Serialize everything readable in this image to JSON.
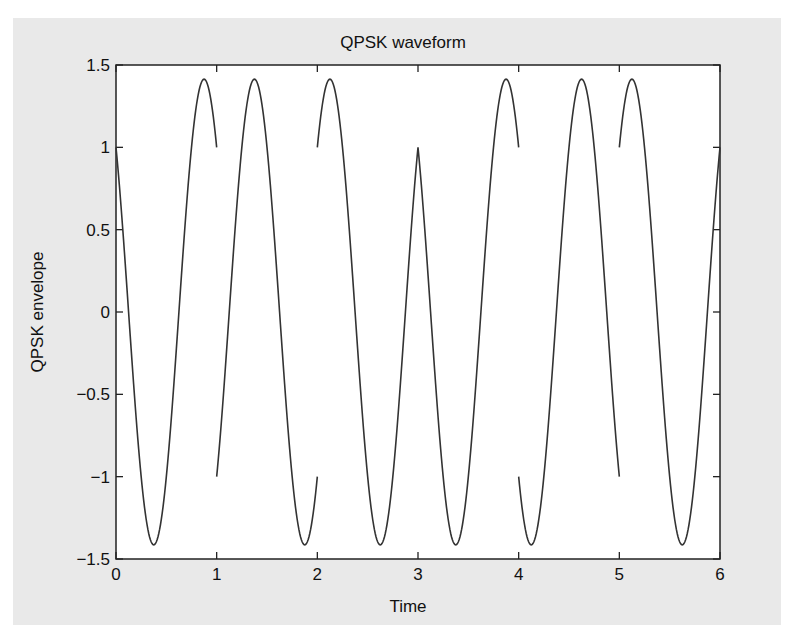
{
  "chart_data": {
    "type": "line",
    "title": "QPSK waveform",
    "xlabel": "Time",
    "ylabel": "QPSK envelope",
    "xlim": [
      0,
      6
    ],
    "ylim": [
      -1.5,
      1.5
    ],
    "xticks": [
      0,
      1,
      2,
      3,
      4,
      5,
      6
    ],
    "xtick_labels": [
      "0",
      "1",
      "2",
      "3",
      "4",
      "5",
      "6"
    ],
    "yticks": [
      -1.5,
      -1,
      -0.5,
      0,
      0.5,
      1,
      1.5
    ],
    "ytick_labels": [
      "−1.5",
      "−1",
      "−0.5",
      "0",
      "0.5",
      "1",
      "1.5"
    ],
    "grid": false,
    "legend": null,
    "series": [
      {
        "name": "QPSK envelope",
        "description": "sqrt(2)*cos(2*pi*t + phase_k) for symbol k in [k, k+1]",
        "amplitude": 1.4142,
        "carrier_frequency": 1,
        "symbol_duration": 1,
        "symbols": [
          {
            "t_start": 0,
            "t_end": 1,
            "phase_deg": 45,
            "start_value": 1,
            "end_value": 1
          },
          {
            "t_start": 1,
            "t_end": 2,
            "phase_deg": 225,
            "start_value": -1,
            "end_value": -1
          },
          {
            "t_start": 2,
            "t_end": 3,
            "phase_deg": 315,
            "start_value": 1,
            "end_value": 1
          },
          {
            "t_start": 3,
            "t_end": 4,
            "phase_deg": 45,
            "start_value": 1,
            "end_value": 1
          },
          {
            "t_start": 4,
            "t_end": 5,
            "phase_deg": 135,
            "start_value": -1,
            "end_value": -1
          },
          {
            "t_start": 5,
            "t_end": 6,
            "phase_deg": 315,
            "start_value": 1,
            "end_value": 1
          }
        ],
        "color": "#333333"
      }
    ]
  },
  "colors": {
    "figure_background": "#e9e9e9",
    "axes_background": "#ffffff",
    "axis_color": "#222222",
    "line_color": "#333333"
  }
}
